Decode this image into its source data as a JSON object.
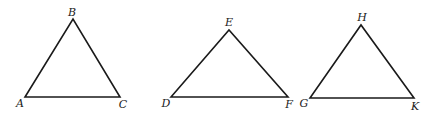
{
  "diagram": {
    "triangles": [
      {
        "name": "ABC",
        "vertices": [
          {
            "label": "A",
            "x": 25,
            "y": 97,
            "lx": 20,
            "ly": 107
          },
          {
            "label": "B",
            "x": 73,
            "y": 19,
            "lx": 72,
            "ly": 16
          },
          {
            "label": "C",
            "x": 120,
            "y": 97,
            "lx": 123,
            "ly": 108
          }
        ]
      },
      {
        "name": "DEF",
        "vertices": [
          {
            "label": "D",
            "x": 171,
            "y": 97,
            "lx": 166,
            "ly": 107
          },
          {
            "label": "E",
            "x": 229,
            "y": 30,
            "lx": 229,
            "ly": 26
          },
          {
            "label": "F",
            "x": 288,
            "y": 97,
            "lx": 289,
            "ly": 108
          }
        ]
      },
      {
        "name": "GHK",
        "vertices": [
          {
            "label": "G",
            "x": 310,
            "y": 98,
            "lx": 304,
            "ly": 107
          },
          {
            "label": "H",
            "x": 361,
            "y": 25,
            "lx": 362,
            "ly": 21
          },
          {
            "label": "K",
            "x": 414,
            "y": 98,
            "lx": 415,
            "ly": 110
          }
        ]
      }
    ],
    "colors": {
      "stroke": "#1a1a1a",
      "background": "#ffffff"
    }
  }
}
